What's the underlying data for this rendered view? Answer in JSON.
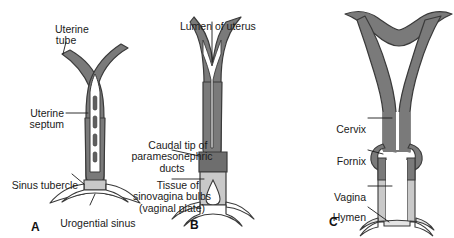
{
  "figure": {
    "background_color": "#ffffff",
    "width": 454,
    "height": 238,
    "colors": {
      "duct_fill": "#7a7a7a",
      "caudal_tip_fill": "#6e6e6e",
      "vaginal_plate_fill": "#c9c9c9",
      "lumen_fill": "#ffffff",
      "outline": "#3a3a3a",
      "label_text": "#1a1a1a",
      "leader_line": "#1a1a1a"
    }
  },
  "panels": [
    {
      "id": "A",
      "letter": "A",
      "labels": [
        {
          "key": "uterine_tube",
          "text": "Uterine\ntube"
        },
        {
          "key": "uterine_septum",
          "text": "Uterine\nseptum"
        },
        {
          "key": "sinus_tubercle",
          "text": "Sinus tubercle"
        },
        {
          "key": "urogenital_sinus",
          "text": "Urogential sinus"
        }
      ]
    },
    {
      "id": "B",
      "letter": "B",
      "labels": [
        {
          "key": "lumen_of_uterus",
          "text": "Lumen of uterus"
        },
        {
          "key": "caudal_tip",
          "text": "Caudal tip of\nparamesonephric\nducts"
        },
        {
          "key": "sinovaginal_bulbs",
          "text": "Tissue of\nsinovagina bulbs\n(vaginal plate)"
        }
      ]
    },
    {
      "id": "C",
      "letter": "C",
      "labels": [
        {
          "key": "cervix",
          "text": "Cervix"
        },
        {
          "key": "fornix",
          "text": "Fornix"
        },
        {
          "key": "vagina",
          "text": "Vagina"
        },
        {
          "key": "hymen",
          "text": "Hymen"
        }
      ]
    }
  ]
}
